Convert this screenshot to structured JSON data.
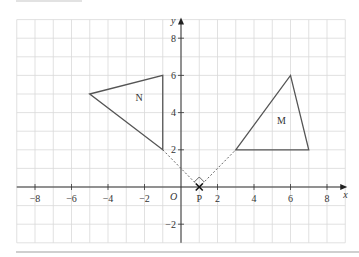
{
  "diagram": {
    "type": "coordinate-grid",
    "x_axis": {
      "label": "x",
      "min": -9,
      "max": 9,
      "tick_labels": [
        "−8",
        "−6",
        "−4",
        "−2",
        "2",
        "4",
        "6",
        "8"
      ],
      "tick_values": [
        -8,
        -6,
        -4,
        -2,
        2,
        4,
        6,
        8
      ]
    },
    "y_axis": {
      "label": "y",
      "min": -3,
      "max": 9,
      "tick_labels": [
        "8",
        "6",
        "4",
        "2",
        "−2"
      ],
      "tick_values": [
        8,
        6,
        4,
        2,
        -2
      ]
    },
    "origin_label": "O",
    "shapes": [
      {
        "name": "N",
        "label": "N",
        "vertices": [
          [
            -5,
            5
          ],
          [
            -1,
            6
          ],
          [
            -1,
            2
          ]
        ],
        "label_pos": [
          -2.3,
          4.6
        ]
      },
      {
        "name": "M",
        "label": "M",
        "vertices": [
          [
            3,
            2
          ],
          [
            6,
            6
          ],
          [
            7,
            2
          ]
        ],
        "label_pos": [
          5.5,
          3.4
        ]
      }
    ],
    "point": {
      "label": "P",
      "x": 1,
      "y": 0,
      "marker": "cross"
    },
    "dashed_lines": [
      [
        [
          -1,
          2
        ],
        [
          1,
          0
        ]
      ],
      [
        [
          1,
          0
        ],
        [
          3,
          2
        ]
      ]
    ],
    "right_angle_at": "P"
  }
}
